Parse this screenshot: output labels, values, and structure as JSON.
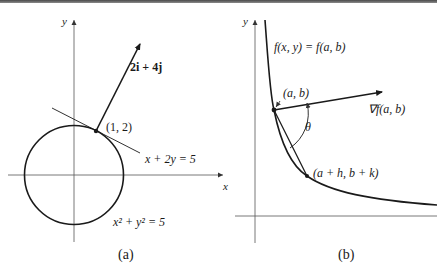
{
  "figure": {
    "panel_a": {
      "caption": "(a)",
      "axis_y_label": "y",
      "axis_x_label": "x",
      "vector_label": "2i + 4j",
      "point_label": "(1, 2)",
      "tangent_label": "x + 2y = 5",
      "circle_label": "x² + y² = 5"
    },
    "panel_b": {
      "caption": "(b)",
      "axis_y_label": "y",
      "curve_label": "f(x, y) = f(a, b)",
      "point_label": "(a, b)",
      "gradient_label": "∇f(a, b)",
      "angle_label": "θ",
      "second_point_label": "(a + h, b + k)"
    },
    "colors": {
      "ink": "#1a1a1a",
      "axis": "#555555",
      "background": "#ffffff"
    }
  }
}
